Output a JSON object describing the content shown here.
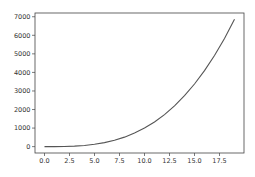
{
  "chart_data": {
    "type": "line",
    "title": "",
    "xlabel": "",
    "ylabel": "",
    "xlim": [
      -0.95,
      19.95
    ],
    "ylim": [
      -343,
      7202
    ],
    "grid": false,
    "legend": null,
    "x_ticks": [
      "0.0",
      "2.5",
      "5.0",
      "7.5",
      "10.0",
      "12.5",
      "15.0",
      "17.5"
    ],
    "y_ticks": [
      "0",
      "1000",
      "2000",
      "3000",
      "4000",
      "5000",
      "6000",
      "7000"
    ],
    "series": [
      {
        "name": "y = x^3",
        "color": "#555555",
        "x": [
          0,
          1,
          2,
          3,
          4,
          5,
          6,
          7,
          8,
          9,
          10,
          11,
          12,
          13,
          14,
          15,
          16,
          17,
          18,
          19
        ],
        "values": [
          0,
          1,
          8,
          27,
          64,
          125,
          216,
          343,
          512,
          729,
          1000,
          1331,
          1728,
          2197,
          2744,
          3375,
          4096,
          4913,
          5832,
          6859
        ]
      }
    ]
  }
}
